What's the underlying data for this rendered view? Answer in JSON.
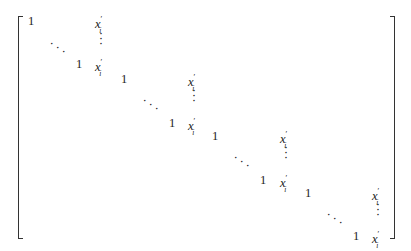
{
  "matrix": {
    "description": "Block-diagonal matrix with identity blocks augmented by column of x'_i",
    "one": "1",
    "x_base": "x",
    "x_prime": "′",
    "x_sub": "i",
    "vdots": "⋮",
    "ddots": "⋱",
    "blocks": [
      {
        "top_one": [
          28,
          14
        ],
        "top_x": [
          95,
          14
        ],
        "ddots": [
          50,
          38
        ],
        "vdots": [
          98,
          32
        ],
        "bot_one": [
          76,
          57
        ],
        "bot_x": [
          95,
          57
        ]
      },
      {
        "top_one": [
          121,
          72
        ],
        "top_x": [
          188,
          72
        ],
        "ddots": [
          143,
          95
        ],
        "vdots": [
          191,
          89
        ],
        "bot_one": [
          169,
          116
        ],
        "bot_x": [
          188,
          116
        ]
      },
      {
        "top_one": [
          212,
          129
        ],
        "top_x": [
          280,
          129
        ],
        "ddots": [
          234,
          152
        ],
        "vdots": [
          283,
          146
        ],
        "bot_one": [
          260,
          173
        ],
        "bot_x": [
          280,
          173
        ]
      },
      {
        "top_one": [
          305,
          186
        ],
        "top_x": [
          372,
          186
        ],
        "ddots": [
          327,
          209
        ],
        "vdots": [
          375,
          203
        ],
        "bot_one": [
          353,
          229
        ],
        "bot_x": [
          372,
          229
        ]
      }
    ]
  }
}
